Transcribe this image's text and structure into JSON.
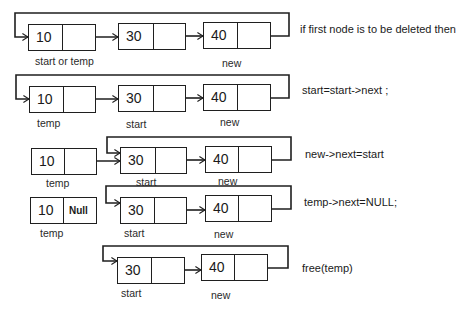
{
  "diagram": {
    "colors": {
      "line": "#1f1f1f",
      "background": "#ffffff"
    },
    "steps": [
      {
        "caption": "if first node is to be deleted then",
        "nodes": [
          {
            "value": "10",
            "next": "",
            "label": "start or temp"
          },
          {
            "value": "30",
            "next": "",
            "label": ""
          },
          {
            "value": "40",
            "next": "",
            "label": "new"
          }
        ]
      },
      {
        "caption": "start=start->next ;",
        "nodes": [
          {
            "value": "10",
            "next": "",
            "label": "temp"
          },
          {
            "value": "30",
            "next": "",
            "label": "start"
          },
          {
            "value": "40",
            "next": "",
            "label": "new"
          }
        ]
      },
      {
        "caption": "new->next=start",
        "nodes": [
          {
            "value": "10",
            "next": "",
            "label": "temp"
          },
          {
            "value": "30",
            "next": "",
            "label": "start"
          },
          {
            "value": "40",
            "next": "",
            "label": "new"
          }
        ]
      },
      {
        "caption": "temp->next=NULL;",
        "nodes": [
          {
            "value": "10",
            "next": "Null",
            "label": "temp"
          },
          {
            "value": "30",
            "next": "",
            "label": "start"
          },
          {
            "value": "40",
            "next": "",
            "label": "new"
          }
        ]
      },
      {
        "caption": "free(temp)",
        "nodes": [
          {
            "value": "30",
            "next": "",
            "label": "start"
          },
          {
            "value": "40",
            "next": "",
            "label": "new"
          }
        ]
      }
    ]
  }
}
